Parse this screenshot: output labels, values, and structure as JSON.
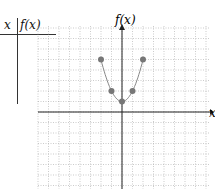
{
  "header": {
    "partial_text": "(x) = x² + 1"
  },
  "table": {
    "col_x": "x",
    "col_fx": "f(x)"
  },
  "chart_data": {
    "type": "scatter",
    "title": "",
    "xlabel": "x",
    "ylabel": "f(x)",
    "x": [
      -2,
      -1,
      0,
      1,
      2
    ],
    "y": [
      5,
      2,
      1,
      2,
      5
    ],
    "curve": "f(x) = x^2 + 1",
    "xlim": [
      -9,
      8
    ],
    "ylim": [
      -8,
      9
    ],
    "grid": true,
    "point_color": "#777777"
  },
  "axis": {
    "y_label": "f(x)",
    "x_label": "x"
  }
}
